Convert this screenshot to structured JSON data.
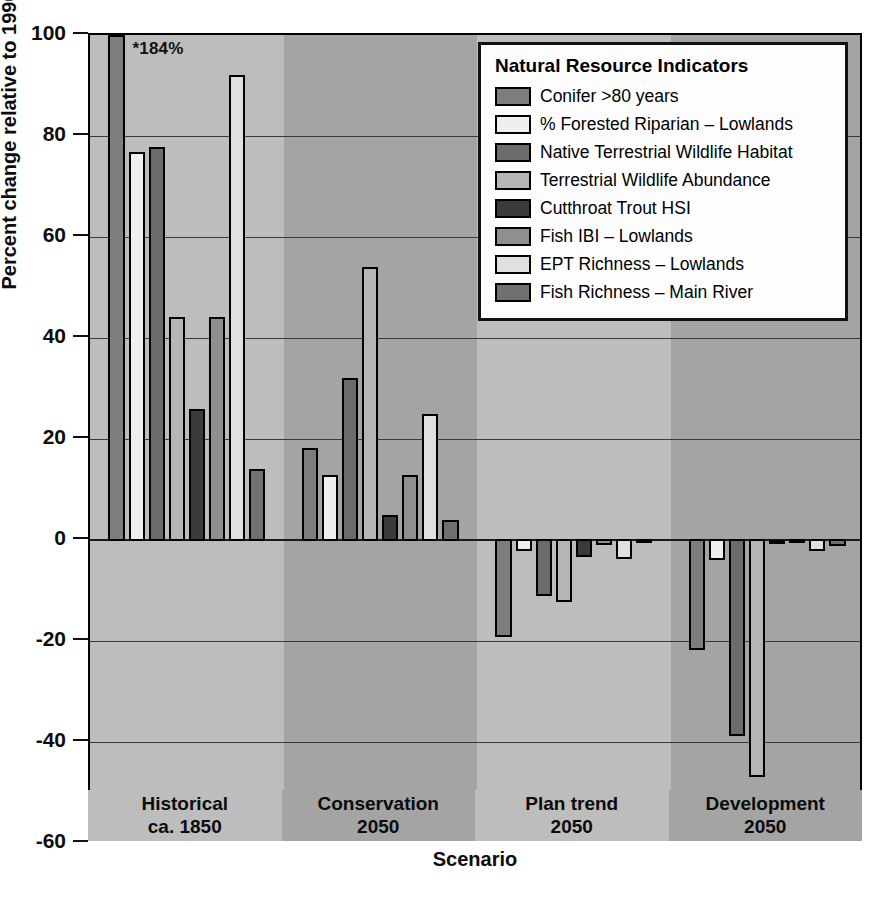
{
  "chart_data": {
    "type": "bar",
    "title": "",
    "xlabel": "Scenario",
    "ylabel": "Percent change  relative to 1990",
    "ylim": [
      -60,
      100
    ],
    "yticks": [
      100,
      80,
      60,
      40,
      20,
      0,
      -20,
      -40,
      -60
    ],
    "ytick_labels": [
      "100",
      "80",
      "60",
      "40",
      "20",
      "0",
      "-20",
      "-40",
      "-60"
    ],
    "grid": true,
    "legend_position": "top-right",
    "legend_title": "Natural Resource Indicators",
    "categories": [
      "Historical ca. 1850",
      "Conservation 2050",
      "Plan trend 2050",
      "Development 2050"
    ],
    "category_lines": [
      [
        "Historical",
        "ca. 1850"
      ],
      [
        "Conservation",
        "2050"
      ],
      [
        "Plan trend",
        "2050"
      ],
      [
        "Development",
        "2050"
      ]
    ],
    "annotations": [
      {
        "text": "*184%",
        "series": "Conifer >80 years",
        "category": "Historical ca. 1850",
        "actual_value": 184,
        "clipped_to": 100
      }
    ],
    "series": [
      {
        "name": "Conifer >80 years",
        "color": "#7d7d7d",
        "values": [
          184,
          18.3,
          -19.3,
          -21.8
        ]
      },
      {
        "name": "% Forested Riparian – Lowlands",
        "color": "#efefef",
        "values": [
          76.8,
          12.8,
          -2.2,
          -4.0
        ]
      },
      {
        "name": "Native Terrestrial Wildlife Habitat",
        "color": "#6b6b6b",
        "values": [
          77.8,
          32.0,
          -11.0,
          -38.8
        ]
      },
      {
        "name": "Terrestrial Wildlife Abundance",
        "color": "#b5b5b5",
        "values": [
          44.2,
          54.0,
          -12.2,
          -47.0
        ]
      },
      {
        "name": "Cutthroat Trout HSI",
        "color": "#3b3b3b",
        "values": [
          26.0,
          5.0,
          -3.4,
          0.0
        ]
      },
      {
        "name": "Fish IBI – Lowlands",
        "color": "#8f8f8f",
        "values": [
          44.2,
          12.9,
          -1.0,
          -0.4
        ]
      },
      {
        "name": "EPT Richness – Lowlands",
        "color": "#e0e0e0",
        "values": [
          92.0,
          25.0,
          -3.8,
          -2.2
        ]
      },
      {
        "name": "Fish Richness – Main River",
        "color": "#707070",
        "values": [
          14.0,
          4.0,
          -0.6,
          -1.2
        ]
      }
    ]
  },
  "legend": {
    "title": "Natural Resource Indicators",
    "items": [
      {
        "label": "Conifer >80 years",
        "swatch": "legend-swatch-conifer"
      },
      {
        "label": "% Forested Riparian – Lowlands",
        "swatch": "legend-swatch-forested-riparian"
      },
      {
        "label": "Native Terrestrial Wildlife Habitat",
        "swatch": "legend-swatch-native-habitat"
      },
      {
        "label": "Terrestrial Wildlife Abundance",
        "swatch": "legend-swatch-wildlife-abundance"
      },
      {
        "label": "Cutthroat Trout HSI",
        "swatch": "legend-swatch-cutthroat-trout"
      },
      {
        "label": "Fish IBI – Lowlands",
        "swatch": "legend-swatch-fish-ibi"
      },
      {
        "label": "EPT Richness – Lowlands",
        "swatch": "legend-swatch-ept-richness"
      },
      {
        "label": "Fish Richness – Main River",
        "swatch": "legend-swatch-fish-richness"
      }
    ]
  },
  "axes": {
    "y_title": "Percent change  relative to 1990",
    "x_title": "Scenario"
  },
  "colors": {
    "band_light": "#bdbdbd",
    "band_dark": "#a4a4a4",
    "outline": "#000000",
    "gridline": "#3a3a3a"
  }
}
